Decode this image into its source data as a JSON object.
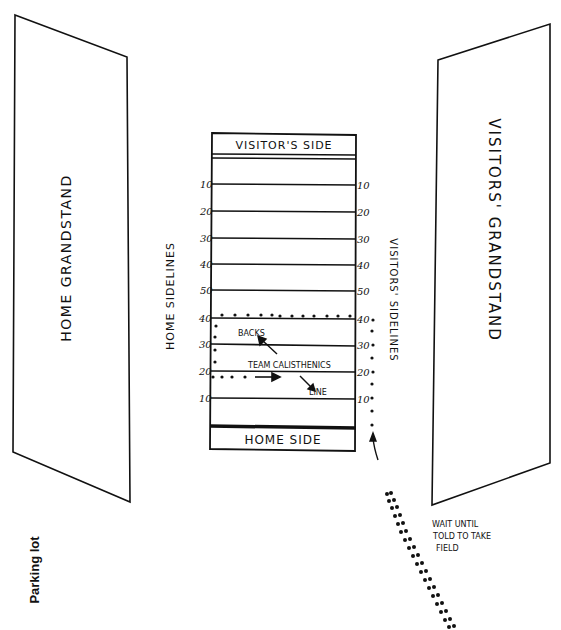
{
  "diagram": {
    "type": "football field pregame positioning diagram",
    "home_grandstand": {
      "label": "HOME GRANDSTAND"
    },
    "visitors_grandstand": {
      "label": "VISITORS' GRANDSTAND"
    },
    "home_sidelines": {
      "label": "HOME SIDELINES"
    },
    "visitors_sidelines": {
      "label": "VISITORS' SIDELINES"
    },
    "field": {
      "top_endzone_label": "VISITOR'S SIDE",
      "bottom_endzone_label": "HOME SIDE",
      "yard_lines_left": [
        "10",
        "20",
        "30",
        "40",
        "50",
        "40",
        "30",
        "20",
        "10"
      ],
      "yard_lines_right": [
        "10",
        "20",
        "30",
        "40",
        "50",
        "40",
        "30",
        "20",
        "10"
      ],
      "annotations": {
        "backs": "BACKS",
        "team_calisthenics": "TEAM CALISTHENICS",
        "line": "LINE"
      }
    },
    "wait_note": [
      "WAIT UNTIL",
      "TOLD TO TAKE",
      "FIELD"
    ],
    "parking_lot": "Parking lot",
    "colors": {
      "ink": "#111111",
      "paper": "#ffffff"
    }
  }
}
